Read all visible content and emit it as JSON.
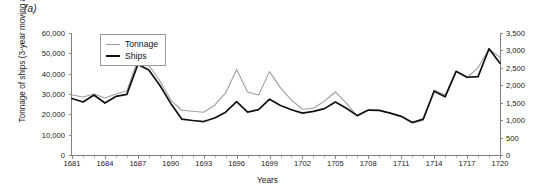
{
  "figure": {
    "panel_label": "(a)"
  },
  "axes": {
    "y_left_title": "Tonnage of ships (3-year moving average)",
    "x_title": "Years",
    "y_left_ticks": [
      "0",
      "10,000",
      "20,000",
      "30,000",
      "40,000",
      "50,000",
      "60,000"
    ],
    "y_right_ticks": [
      "0",
      "500",
      "1,000",
      "1,500",
      "2,000",
      "2,500",
      "3,000",
      "3,500"
    ],
    "x_ticks": [
      "1681",
      "1684",
      "1687",
      "1690",
      "1693",
      "1696",
      "1699",
      "1702",
      "1705",
      "1708",
      "1711",
      "1714",
      "1717",
      "1720"
    ]
  },
  "legend": {
    "items": [
      {
        "label": "Tonnage",
        "color": "#9e9e9e"
      },
      {
        "label": "Ships",
        "color": "#111111"
      }
    ]
  },
  "chart_data": {
    "type": "line",
    "title": "",
    "xlabel": "Years",
    "ylabel": "Tonnage of ships (3-year moving average)",
    "ylabel_right": "Ships",
    "xlim": [
      1681,
      1720
    ],
    "ylim": [
      0,
      60000
    ],
    "ylim_right": [
      0,
      3500
    ],
    "grid": false,
    "legend_position": "top-left-inside",
    "x": [
      1681,
      1682,
      1683,
      1684,
      1685,
      1686,
      1687,
      1688,
      1689,
      1690,
      1691,
      1692,
      1693,
      1694,
      1695,
      1696,
      1697,
      1698,
      1699,
      1700,
      1701,
      1702,
      1703,
      1704,
      1705,
      1706,
      1707,
      1708,
      1709,
      1710,
      1711,
      1712,
      1713,
      1714,
      1715,
      1716,
      1717,
      1718,
      1719,
      1720
    ],
    "series": [
      {
        "name": "Tonnage",
        "color": "#9e9e9e",
        "axis": "left",
        "values": [
          29500,
          28500,
          30000,
          28000,
          30000,
          31500,
          47000,
          44000,
          36500,
          27000,
          22000,
          21500,
          21000,
          24500,
          30500,
          42000,
          31000,
          29500,
          41000,
          33000,
          27000,
          22500,
          23000,
          26500,
          31000,
          25500,
          19000,
          22000,
          22000,
          20500,
          19000,
          16000,
          17000,
          32000,
          29500,
          41000,
          38000,
          43000,
          52000,
          48000
        ]
      },
      {
        "name": "Ships",
        "color": "#111111",
        "axis": "right",
        "values": [
          1620,
          1520,
          1720,
          1490,
          1680,
          1740,
          2600,
          2440,
          2000,
          1480,
          1030,
          990,
          960,
          1060,
          1230,
          1530,
          1230,
          1300,
          1600,
          1420,
          1300,
          1200,
          1250,
          1330,
          1520,
          1340,
          1130,
          1290,
          1280,
          1200,
          1110,
          930,
          1030,
          1830,
          1670,
          2400,
          2230,
          2250,
          3050,
          2630
        ]
      }
    ]
  }
}
